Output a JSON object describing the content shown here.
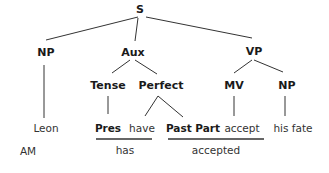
{
  "diagram": {
    "type": "syntax-tree",
    "nodes": {
      "S": "S",
      "NP1": "NP",
      "Aux": "Aux",
      "VP": "VP",
      "Tense": "Tense",
      "Perfect": "Perfect",
      "MV": "MV",
      "NP2": "NP"
    },
    "leaves": {
      "leon": "Leon",
      "pres": "Pres",
      "have": "have",
      "pastpart": "Past Part",
      "accept": "accept",
      "hisfate": "his fate"
    },
    "annotations": {
      "am": "AM",
      "has": "has",
      "accepted": "accepted"
    }
  }
}
